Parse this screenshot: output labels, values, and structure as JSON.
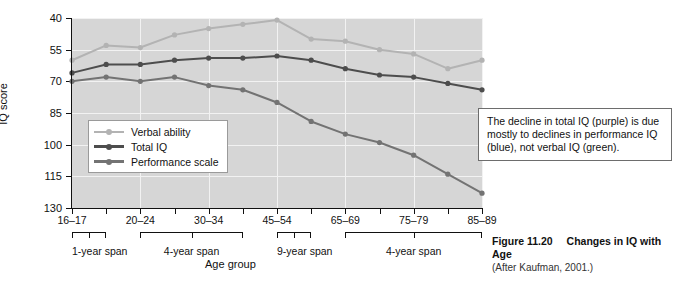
{
  "chart_data": {
    "type": "line",
    "title": "Changes in IQ with Age",
    "xlabel": "Age group",
    "ylabel": "IQ score",
    "ylim": [
      40,
      130
    ],
    "yticks": [
      40,
      55,
      70,
      85,
      100,
      115,
      130
    ],
    "grid": true,
    "legend_position": "inside lower-left",
    "x": [
      "16–17",
      "18–19",
      "20–24",
      "25–29",
      "30–34",
      "35–44",
      "45–54",
      "55–64",
      "65–69",
      "70–74",
      "75–79",
      "80–84",
      "85–89"
    ],
    "xtick_labels": [
      "16–17",
      "20–24",
      "30–34",
      "45–54",
      "65–69",
      "75–79",
      "85–89"
    ],
    "xtick_indices": [
      0,
      2,
      4,
      6,
      8,
      10,
      12
    ],
    "series": [
      {
        "name": "Verbal ability",
        "color": "#b3b3b3",
        "values": [
          110,
          117,
          116,
          122,
          125,
          127,
          129,
          120,
          119,
          115,
          113,
          106,
          110
        ]
      },
      {
        "name": "Total IQ",
        "color": "#4d4d4d",
        "values": [
          104,
          108,
          108,
          110,
          111,
          111,
          112,
          110,
          106,
          103,
          102,
          99,
          96
        ]
      },
      {
        "name": "Performance scale",
        "color": "#737373",
        "values": [
          100,
          102,
          100,
          102,
          98,
          96,
          90,
          81,
          75,
          71,
          65,
          56,
          47
        ]
      }
    ],
    "annotation": "The decline in total IQ (purple) is due mostly to declines in performance IQ (blue), not verbal IQ (green).",
    "spans": [
      {
        "label": "1-year span",
        "start_index": 0,
        "end_index": 1
      },
      {
        "label": "4-year span",
        "start_index": 2,
        "end_index": 5
      },
      {
        "label": "9-year span",
        "start_index": 6,
        "end_index": 7
      },
      {
        "label": "4-year span",
        "start_index": 8,
        "end_index": 12
      }
    ]
  },
  "ylabel": "IQ score",
  "xlabel": "Age group",
  "yticks": [
    "130",
    "115",
    "100",
    "85",
    "70",
    "55",
    "40"
  ],
  "xticks": [
    "16–17",
    "20–24",
    "30–34",
    "45–54",
    "65–69",
    "75–79",
    "85–89"
  ],
  "legend": {
    "items": [
      {
        "label": "Verbal ability",
        "color": "#b3b3b3"
      },
      {
        "label": "Total IQ",
        "color": "#4d4d4d"
      },
      {
        "label": "Performance scale",
        "color": "#737373"
      }
    ]
  },
  "annotation": {
    "text": "The decline in total IQ (purple) is due mostly to declines in performance IQ (blue), not verbal IQ (green)."
  },
  "spans": [
    {
      "label": "1-year span"
    },
    {
      "label": "4-year span"
    },
    {
      "label": "9-year span"
    },
    {
      "label": "4-year span"
    }
  ],
  "caption": {
    "figure_number": "Figure 11.20",
    "figure_title": "Changes in IQ with Age",
    "source": "(After Kaufman, 2001.)"
  }
}
